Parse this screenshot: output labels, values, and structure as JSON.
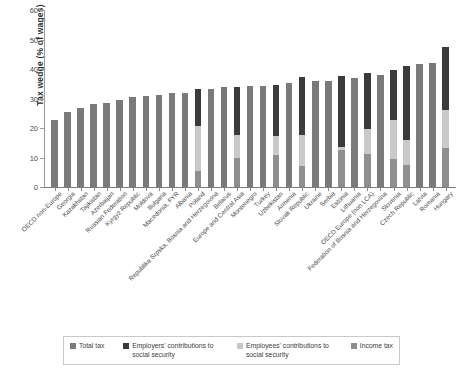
{
  "chart_data": {
    "type": "bar",
    "title": "",
    "subtitle": "",
    "xlabel": "",
    "ylabel": "Tax wedge (% of wages)",
    "ylim": [
      0,
      60
    ],
    "yticks": [
      0,
      10,
      20,
      30,
      40,
      50,
      60
    ],
    "grid": false,
    "stacked": true,
    "legend_position": "bottom",
    "legend": [
      "Total tax",
      "Employers' contributions to social security",
      "Employees' contributions to social security",
      "Income tax"
    ],
    "colors": {
      "total_tax": "#7a7a7a",
      "employers_contributions": "#3b3b3b",
      "employees_contributions": "#c9c9c9",
      "income_tax": "#8f8f8f"
    },
    "categories": [
      "OECD non-Europe",
      "Georgia",
      "Kazakhstan",
      "Tajikistan",
      "Azerbaijan",
      "Russian Federation",
      "Kyrgyz Republic",
      "Moldova",
      "Bulgaria",
      "Macedonia, FYR",
      "Albania",
      "Poland",
      "Republika Srpska, Bosnia and Herzegovina",
      "Belarus",
      "Europe and Central Asia",
      "Montenegro",
      "Turkey",
      "Uzbekistan",
      "Armenia",
      "Slovak Republic",
      "Ukraine",
      "Serbia",
      "Estonia",
      "Lithuania",
      "OECD Europe (non LCA)",
      "Federation of Bosnia and Herzegovina",
      "Slovenia",
      "Czech Republic",
      "Latvia",
      "Romania",
      "Hungary"
    ],
    "series": [
      {
        "name": "Total tax",
        "values": [
          22.6,
          25.3,
          26.8,
          28.2,
          28.6,
          29.5,
          30.4,
          30.9,
          31.2,
          31.8,
          32.0,
          0,
          33.2,
          33.8,
          0,
          34.2,
          34.4,
          0,
          35.2,
          0,
          35.8,
          36.1,
          0,
          36.9,
          0,
          38.0,
          0,
          0,
          41.6,
          42.1,
          0
        ]
      },
      {
        "name": "Income tax",
        "values": [
          0,
          0,
          0,
          0,
          0,
          0,
          0,
          0,
          0,
          0,
          0,
          5.5,
          0,
          0,
          9.8,
          0,
          0,
          11.0,
          0,
          7.0,
          0,
          0,
          12.4,
          0,
          11.3,
          0,
          9.6,
          7.5,
          0,
          0,
          13.2
        ]
      },
      {
        "name": "Employees' contributions to social security",
        "values": [
          0,
          0,
          0,
          0,
          0,
          0,
          0,
          0,
          0,
          0,
          0,
          15.1,
          0,
          0,
          8.0,
          0,
          0,
          6.2,
          0,
          10.5,
          0,
          0,
          1.2,
          0,
          8.5,
          0,
          13.2,
          8.5,
          0,
          0,
          12.8
        ]
      },
      {
        "name": "Employers' contributions to social security",
        "values": [
          0,
          0,
          0,
          0,
          0,
          0,
          0,
          0,
          0,
          0,
          0,
          12.6,
          0,
          0,
          16.1,
          0,
          0,
          17.5,
          0,
          19.9,
          0,
          0,
          24.2,
          0,
          18.8,
          0,
          17.0,
          25.0,
          0,
          0,
          21.4
        ]
      }
    ],
    "totals": [
      22.6,
      25.3,
      26.8,
      28.2,
      28.6,
      29.5,
      30.4,
      30.9,
      31.2,
      31.8,
      32.0,
      33.2,
      33.2,
      33.8,
      33.9,
      34.2,
      34.4,
      34.7,
      35.2,
      37.4,
      35.8,
      36.1,
      37.8,
      36.9,
      38.6,
      38.0,
      39.8,
      41.0,
      41.6,
      42.1,
      47.4
    ]
  },
  "legend": {
    "items": [
      {
        "label": "Total tax",
        "color": "#7a7a7a",
        "key": "total"
      },
      {
        "label": "Employers' contributions to social security",
        "color": "#3b3b3b",
        "key": "employer"
      },
      {
        "label": "Employees' contributions to social security",
        "color": "#c9c9c9",
        "key": "employee"
      },
      {
        "label": "Income tax",
        "color": "#8f8f8f",
        "key": "income"
      }
    ]
  },
  "axis": {
    "y_title": "Tax wedge (% of wages)",
    "y_ticks": [
      "0",
      "10",
      "20",
      "30",
      "40",
      "50",
      "60"
    ]
  }
}
